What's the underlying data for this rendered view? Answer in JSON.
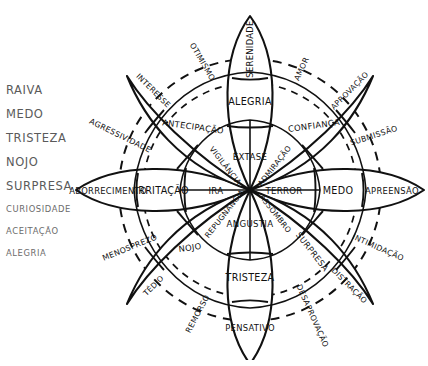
{
  "legend": {
    "items": [
      {
        "label": "RAIVA",
        "size": "big"
      },
      {
        "label": "MEDO",
        "size": "big"
      },
      {
        "label": "TRISTEZA",
        "size": "big"
      },
      {
        "label": "NOJO",
        "size": "big"
      },
      {
        "label": "SURPRESA",
        "size": "big"
      },
      {
        "label": "CURIOSIDADE",
        "size": "small"
      },
      {
        "label": "ACEITAÇÃO",
        "size": "small"
      },
      {
        "label": "ALEGRIA",
        "size": "small"
      }
    ]
  },
  "wheel": {
    "primary_petals": [
      {
        "angle": -90,
        "core": "ÊXTASE",
        "mid": "ALEGRIA",
        "outer": "SERENIDADE"
      },
      {
        "angle": 0,
        "core": "TERROR",
        "mid": "MEDO",
        "outer": "APREENSÃO"
      },
      {
        "angle": 90,
        "core": "ANGÚSTIA",
        "mid": "TRISTEZA",
        "outer": "PENSATIVO"
      },
      {
        "angle": 180,
        "core": "IRA",
        "mid": "IRRITAÇÃO",
        "outer": "ABORRECIMENTO"
      }
    ],
    "diagonal_petals": [
      {
        "angle": -45,
        "core": "ADMIRAÇÃO",
        "mid": "CONFIANÇA",
        "outer": "APROVAÇÃO"
      },
      {
        "angle": 45,
        "core": "ASSOMBRO",
        "mid": "SURPRESA",
        "outer": "DISTRAÇÃO"
      },
      {
        "angle": 135,
        "core": "REPUGNÂNCIA",
        "mid": "NOJO",
        "outer": "TÉDIO"
      },
      {
        "angle": -135,
        "core": "VIGILÂNCIA",
        "mid": "ANTECIPAÇÃO",
        "outer": "INTERESSE"
      }
    ],
    "dyads": [
      {
        "label": "OTIMISMO",
        "angle": -112.5
      },
      {
        "label": "AMOR",
        "angle": -67.5
      },
      {
        "label": "SUBMISSÃO",
        "angle": -22.5
      },
      {
        "label": "INTIMIDAÇÃO",
        "angle": 22.5
      },
      {
        "label": "DESAPROVAÇÃO",
        "angle": 67.5
      },
      {
        "label": "REMORSO",
        "angle": 112.5
      },
      {
        "label": "MENOSPREZO",
        "angle": 157.5
      },
      {
        "label": "AGRESSIVIDADE",
        "angle": -157.5
      }
    ],
    "colors": {
      "ink": "#111111",
      "paper": "#ffffff",
      "legend_text": "#5a5a5a"
    }
  }
}
